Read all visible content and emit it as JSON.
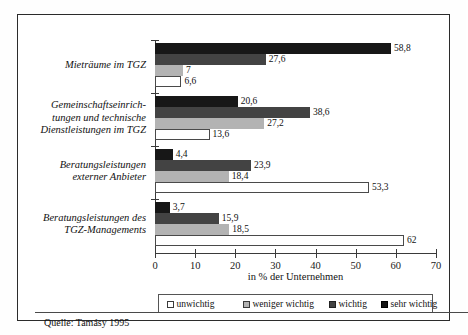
{
  "chart_data": {
    "type": "bar",
    "orientation": "horizontal",
    "title": "",
    "xlabel": "in % der Unternehmen",
    "ylabel": "",
    "xlim": [
      0,
      70
    ],
    "xticks": [
      0,
      10,
      20,
      30,
      40,
      50,
      60,
      70
    ],
    "xtick_labels": [
      "0",
      "10",
      "20",
      "30",
      "40",
      "50",
      "60",
      "70"
    ],
    "grid": false,
    "legend_position": "bottom",
    "categories": [
      "Mieträume im TGZ",
      "Gemeinschaftseinrich-\ntungen und technische\nDienstleistungen im TGZ",
      "Beratungsleistungen\nexterner Anbieter",
      "Beratungsleistungen des\nTGZ-Managements"
    ],
    "category_lines": [
      [
        "Mieträume im TGZ"
      ],
      [
        "Gemeinschaftseinrich-",
        "tungen und technische",
        "Dienstleistungen im TGZ"
      ],
      [
        "Beratungsleistungen",
        "externer Anbieter"
      ],
      [
        "Beratungsleistungen des",
        "TGZ-Managements"
      ]
    ],
    "series": [
      {
        "name": "unwichtig",
        "color": "#ffffff",
        "values": [
          6.6,
          13.6,
          53.3,
          62
        ],
        "labels": [
          "6,6",
          "13,6",
          "53,3",
          "62"
        ]
      },
      {
        "name": "weniger wichtig",
        "color": "#b3b3b3",
        "values": [
          7,
          27.2,
          18.4,
          18.5
        ],
        "labels": [
          "7",
          "27,2",
          "18,4",
          "18,5"
        ]
      },
      {
        "name": "wichtig",
        "color": "#434343",
        "values": [
          27.6,
          38.6,
          23.9,
          15.9
        ],
        "labels": [
          "27,6",
          "38,6",
          "23,9",
          "15,9"
        ]
      },
      {
        "name": "sehr wichtig",
        "color": "#141414",
        "values": [
          58.8,
          20.6,
          4.4,
          3.7
        ],
        "labels": [
          "58,8",
          "20,6",
          "4,4",
          "3,7"
        ]
      }
    ]
  },
  "legend": {
    "items": [
      {
        "label": "unwichtig",
        "swatch": "sw-unwichtig"
      },
      {
        "label": "weniger wichtig",
        "swatch": "sw-weniger"
      },
      {
        "label": "wichtig",
        "swatch": "sw-wichtig"
      },
      {
        "label": "sehr wichtig",
        "swatch": "sw-sehr"
      }
    ]
  },
  "axis": {
    "title": "in % der Unternehmen"
  },
  "source": {
    "text": "Quelle: Tamásy 1995"
  }
}
